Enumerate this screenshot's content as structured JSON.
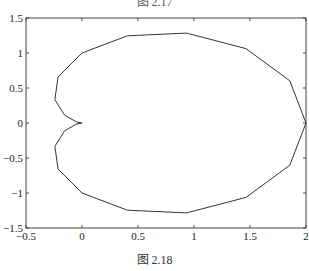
{
  "captions": {
    "top": "图 2.17",
    "bottom": "图 2.18"
  },
  "colors": {
    "line": "#333333",
    "axes": "#444444"
  },
  "chart_data": {
    "type": "line",
    "title": "",
    "xlabel": "",
    "ylabel": "",
    "xlim": [
      -0.5,
      2
    ],
    "ylim": [
      -1.5,
      1.5
    ],
    "grid": false,
    "legend": null,
    "x_ticks": [
      -0.5,
      0,
      0.5,
      1,
      1.5,
      2
    ],
    "x_tick_labels": [
      "-0.5",
      "0",
      "0.5",
      "1",
      "1.5",
      "2"
    ],
    "y_ticks": [
      -1.5,
      -1,
      -0.5,
      0,
      0.5,
      1,
      1.5
    ],
    "y_tick_labels": [
      "-1.5",
      "-1",
      "-0.5",
      "0",
      "0.5",
      "1",
      "1.5"
    ],
    "series": [
      {
        "name": "cardioid",
        "x": [
          2.0,
          1.855,
          1.464,
          0.933,
          0.405,
          0.0,
          -0.214,
          -0.242,
          -0.155,
          -0.047,
          0.0,
          -0.047,
          -0.155,
          -0.242,
          -0.214,
          0.0,
          0.405,
          0.933,
          1.464,
          1.855,
          2.0
        ],
        "y": [
          0.0,
          0.603,
          1.063,
          1.285,
          1.245,
          1.0,
          0.657,
          0.333,
          0.112,
          0.015,
          0.0,
          -0.015,
          -0.112,
          -0.333,
          -0.657,
          -1.0,
          -1.245,
          -1.285,
          -1.063,
          -0.603,
          0.0
        ]
      }
    ]
  }
}
